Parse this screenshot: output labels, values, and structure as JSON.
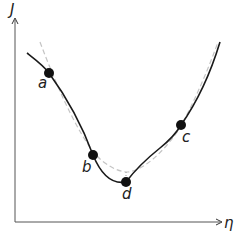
{
  "diagram": {
    "axes": {
      "y_label": "J",
      "x_label": "η"
    },
    "curves": [
      {
        "name": "true-cost-curve",
        "style": "solid",
        "color": "#1a1a1a"
      },
      {
        "name": "approximate-curve",
        "style": "dashed",
        "color": "#c0c0c0"
      }
    ],
    "points": [
      {
        "label": "a",
        "x": 49,
        "y": 73
      },
      {
        "label": "b",
        "x": 93,
        "y": 155
      },
      {
        "label": "c",
        "x": 181,
        "y": 125
      },
      {
        "label": "d",
        "x": 126,
        "y": 182
      }
    ]
  }
}
